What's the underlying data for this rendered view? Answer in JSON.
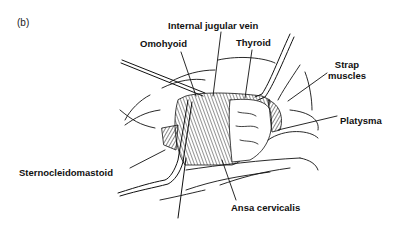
{
  "panel_label": "(b)",
  "labels": {
    "internal_jugular_vein": "Internal jugular vein",
    "omohyoid": "Omohyoid",
    "thyroid": "Thyroid",
    "strap_muscles_1": "Strap",
    "strap_muscles_2": "muscles",
    "platysma": "Platysma",
    "sternocleidomastoid": "Sternocleidomastoid",
    "ansa_cervicalis": "Ansa cervicalis"
  }
}
